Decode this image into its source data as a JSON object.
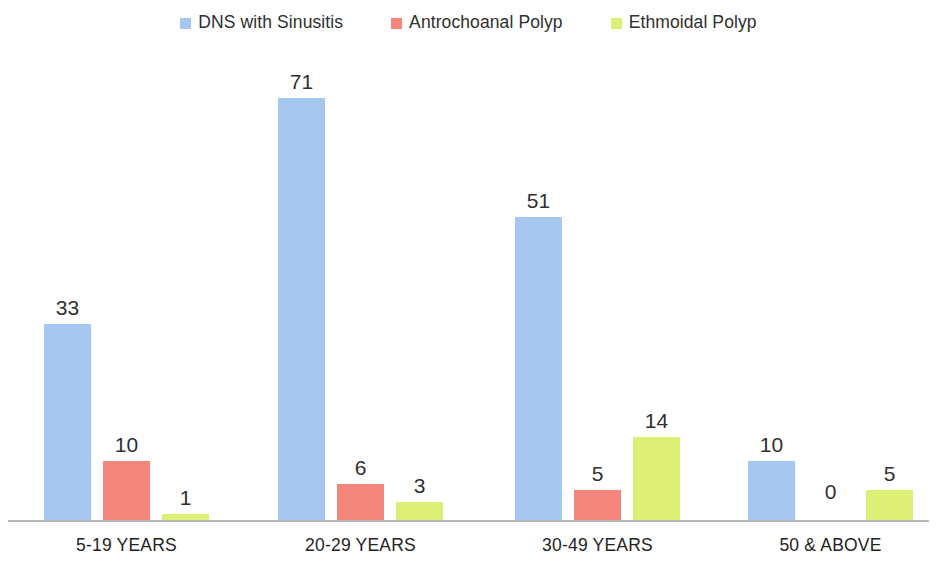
{
  "chart_data": {
    "type": "bar",
    "title": "",
    "subtitle": "",
    "xlabel": "",
    "ylabel": "",
    "grid": false,
    "legend_position": "top-center",
    "axis_visible": {
      "x_baseline": true,
      "y_axis": false,
      "y_ticks": false
    },
    "ylim": [
      0,
      78
    ],
    "categories": [
      "5-19 YEARS",
      "20-29 YEARS",
      "30-49 YEARS",
      "50 & ABOVE"
    ],
    "series": [
      {
        "name": "DNS with Sinusitis",
        "color": "#a6c8f0",
        "values": [
          33,
          71,
          51,
          10
        ]
      },
      {
        "name": "Antrochoanal Polyp",
        "color": "#f4867e",
        "values": [
          10,
          6,
          5,
          0
        ]
      },
      {
        "name": "Ethmoidal Polyp",
        "color": "#ddef75",
        "values": [
          1,
          3,
          14,
          5
        ]
      }
    ],
    "data_labels": [
      [
        "33",
        "10",
        "1"
      ],
      [
        "71",
        "6",
        "3"
      ],
      [
        "51",
        "5",
        "14"
      ],
      [
        "10",
        "0",
        "5"
      ]
    ]
  },
  "legend": {
    "items": [
      {
        "label": "DNS with Sinusitis",
        "color": "#a6c8f0"
      },
      {
        "label": "Antrochoanal Polyp",
        "color": "#f4867e"
      },
      {
        "label": "Ethmoidal Polyp",
        "color": "#ddef75"
      }
    ]
  },
  "axis": {
    "categories": [
      "5-19 YEARS",
      "20-29 YEARS",
      "30-49 YEARS",
      "50 & ABOVE"
    ]
  },
  "colors": {
    "series_blue": "#a6c8f0",
    "series_red": "#f4867e",
    "series_yellow": "#ddef75",
    "baseline": "#b9b9b9",
    "text": "#2b2b2b",
    "background": "#ffffff"
  }
}
